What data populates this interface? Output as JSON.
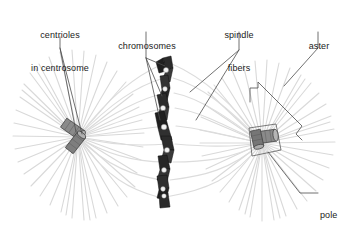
{
  "figure": {
    "background_color": "#ffffff",
    "width": 355,
    "height": 225
  },
  "labels": [
    {
      "id": "centrioles",
      "line1": "centrioles",
      "line2": "in centrosome",
      "x": 13,
      "y": 8,
      "w": 94
    },
    {
      "id": "chromosomes",
      "line1": "chromosomes",
      "line2": "",
      "x": 105,
      "y": 19,
      "w": 84
    },
    {
      "id": "spindle-fibers",
      "line1": "spindle",
      "line2": "fibers",
      "x": 208,
      "y": 8,
      "w": 62
    },
    {
      "id": "aster",
      "line1": "aster",
      "line2": "",
      "x": 296,
      "y": 19,
      "w": 46
    },
    {
      "id": "pole",
      "line1": "pole",
      "line2": "",
      "x": 320,
      "y": 190,
      "w": 30
    }
  ],
  "structures": {
    "left_aster": {
      "name": "aster-left",
      "center_x": 78,
      "center_y": 137,
      "ray_count": 40,
      "color": "#d9d9d9"
    },
    "right_aster": {
      "name": "aster-right",
      "center_x": 262,
      "center_y": 143,
      "ray_count": 40,
      "color": "#d9d9d9"
    },
    "left_centriole_pair": {
      "name": "centriole-pair-left",
      "x": 78,
      "y": 137,
      "color": "#6e6e6e"
    },
    "right_centriole_pair": {
      "name": "centriole-pair-right",
      "x": 262,
      "y": 143,
      "color": "#6e6e6e"
    },
    "chromosomes": {
      "name": "chromosome-group",
      "count": 8,
      "color": "#2b2b2b",
      "centromere_color": "#f2f2f2"
    },
    "spindle_fibers": {
      "name": "spindle-fiber-group",
      "color": "#dcdcdc"
    },
    "leader_lines": {
      "name": "leader-lines",
      "color": "#4d4d4d"
    }
  },
  "colors": {
    "chromosome": "#2b2b2b",
    "centriole": "#6e6e6e",
    "aster_ray": "#d9d9d9",
    "spindle_fiber": "#dcdcdc",
    "leader": "#4d4d4d",
    "text": "#1a1a1a"
  }
}
